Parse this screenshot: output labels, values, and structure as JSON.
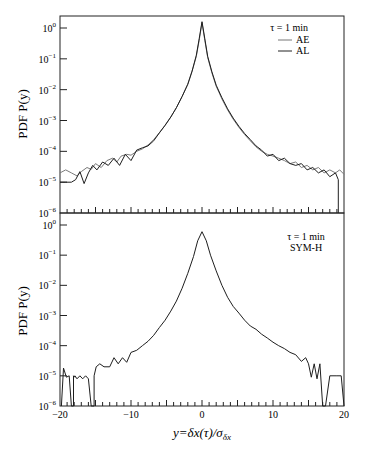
{
  "figure": {
    "xlabel": "y=δx(τ)/σ",
    "xlabel_sub": "δx",
    "ylabel": "PDF P(y)"
  },
  "chart_data": [
    {
      "type": "line",
      "panel": "top",
      "title": "",
      "xlabel": "y=δx(τ)/σ_δx",
      "ylabel": "PDF P(y)",
      "xlim": [
        -20,
        20
      ],
      "ylim": [
        1e-06,
        2
      ],
      "yscale": "log",
      "yticks": [
        "10^0",
        "10^-1",
        "10^-2",
        "10^-3",
        "10^-4",
        "10^-5",
        "10^-6"
      ],
      "xticks": [],
      "grid": false,
      "legend": {
        "position": "upper right",
        "header": "τ = 1 min",
        "entries": [
          "AE",
          "AL"
        ]
      },
      "series": [
        {
          "name": "AE",
          "x": [
            -20,
            -19.2,
            -18.4,
            -17.6,
            -17,
            -16.2,
            -15.6,
            -15,
            -14.2,
            -13.4,
            -12.6,
            -12,
            -11.4,
            -10.6,
            -10,
            -9.2,
            -8.4,
            -7.6,
            -6.8,
            -6,
            -5.2,
            -4.4,
            -3.6,
            -2.8,
            -2,
            -1.4,
            -0.8,
            -0.4,
            0,
            0.4,
            0.8,
            1.4,
            2,
            2.8,
            3.6,
            4.4,
            5.2,
            6,
            6.8,
            7.6,
            8.4,
            9.2,
            10,
            10.8,
            11.6,
            12.4,
            13.2,
            14,
            14.8,
            15.6,
            16.4,
            17.2,
            18,
            18.8,
            19.4,
            20
          ],
          "y": [
            2e-05,
            2.5e-05,
            2e-05,
            1.6e-05,
            2.2e-05,
            3e-05,
            2.6e-05,
            4e-05,
            3e-05,
            5e-05,
            6e-05,
            4.5e-05,
            7e-05,
            8e-05,
            7.5e-05,
            0.0001,
            0.00012,
            0.00016,
            0.00024,
            0.0004,
            0.0007,
            0.0013,
            0.0026,
            0.006,
            0.015,
            0.04,
            0.12,
            0.4,
            1.5,
            0.4,
            0.11,
            0.035,
            0.013,
            0.005,
            0.0022,
            0.0011,
            0.0006,
            0.00035,
            0.00022,
            0.00014,
            0.0001,
            8e-05,
            7e-05,
            6e-05,
            5e-05,
            4e-05,
            4.5e-05,
            3e-05,
            3.5e-05,
            2.5e-05,
            3e-05,
            2e-05,
            2.5e-05,
            2e-05,
            2.5e-05,
            1.8e-05
          ]
        },
        {
          "name": "AL",
          "x": [
            -20,
            -19.2,
            -18.4,
            -17.8,
            -17.2,
            -16.6,
            -16,
            -15.4,
            -14.8,
            -14,
            -13.2,
            -12.4,
            -11.6,
            -10.8,
            -10,
            -9.2,
            -8.4,
            -7.6,
            -6.8,
            -6,
            -5.2,
            -4.4,
            -3.6,
            -2.8,
            -2,
            -1.4,
            -0.8,
            -0.4,
            0,
            0.4,
            0.8,
            1.4,
            2,
            2.8,
            3.6,
            4.4,
            5.2,
            6,
            6.8,
            7.6,
            8.4,
            9.2,
            10,
            10.8,
            11.6,
            12.4,
            13.2,
            14,
            14.8,
            15.6,
            16.4,
            17.2,
            18,
            18.8,
            19.2,
            19.2
          ],
          "y": [
            1e-05,
            1e-05,
            1e-05,
            1.2e-05,
            2.2e-05,
            9e-06,
            2e-05,
            3.5e-05,
            2.5e-05,
            4.5e-05,
            3.5e-05,
            6e-05,
            3.5e-05,
            8e-05,
            5e-05,
            0.00011,
            0.00013,
            0.00015,
            0.00022,
            0.0004,
            0.0007,
            0.0013,
            0.0026,
            0.006,
            0.015,
            0.04,
            0.13,
            0.45,
            1.6,
            0.45,
            0.12,
            0.038,
            0.014,
            0.0055,
            0.0024,
            0.0012,
            0.00065,
            0.00038,
            0.00024,
            0.00015,
            0.00011,
            7e-05,
            8e-05,
            5e-05,
            6e-05,
            4e-05,
            3.5e-05,
            4e-05,
            2.5e-05,
            3e-05,
            2e-05,
            2.5e-05,
            1.5e-05,
            2e-05,
            1.2e-05,
            1e-06
          ]
        }
      ]
    },
    {
      "type": "line",
      "panel": "bottom",
      "title": "",
      "xlabel": "y=δx(τ)/σ_δx",
      "ylabel": "PDF P(y)",
      "xlim": [
        -20,
        20
      ],
      "ylim": [
        1e-06,
        2
      ],
      "yscale": "log",
      "yticks": [
        "10^0",
        "10^-1",
        "10^-2",
        "10^-3",
        "10^-4",
        "10^-5",
        "10^-6"
      ],
      "xticks": [
        "-20",
        "-10",
        "0",
        "10",
        "20"
      ],
      "grid": false,
      "legend": {
        "position": "upper right",
        "header": "τ = 1 min",
        "entries": [
          "SYM-H"
        ]
      },
      "series": [
        {
          "name": "SYM-H",
          "x": [
            -19.8,
            -19.5,
            -19.1,
            -18.7,
            -18.4,
            -18.1,
            -18.1,
            -17.9,
            -17.9,
            -17.6,
            -17.2,
            -16.8,
            -16.4,
            -16,
            -15.6,
            -15.6,
            -15.2,
            -15.2,
            -14.9,
            -14.4,
            -13.8,
            -13,
            -12.4,
            -11.8,
            -11.2,
            -10.6,
            -10,
            -9.2,
            -8.4,
            -7.6,
            -6.8,
            -6,
            -5.2,
            -4.4,
            -3.6,
            -2.8,
            -2,
            -1.2,
            -0.6,
            0,
            0.6,
            1.2,
            2,
            2.8,
            3.6,
            4.4,
            5.2,
            6,
            6.8,
            7.6,
            8.4,
            9.2,
            10,
            10.8,
            11.6,
            12.4,
            13.2,
            14,
            14.6,
            15,
            15.4,
            15.8,
            16.2,
            16.6,
            17,
            17,
            17.4,
            17.4,
            18,
            19,
            19.6,
            20
          ],
          "y": [
            1e-06,
            1.8e-05,
            9e-06,
            1e-05,
            1e-06,
            1e-06,
            1e-05,
            9e-06,
            1e-05,
            8e-06,
            1e-05,
            8e-06,
            1e-05,
            8e-06,
            1e-06,
            1e-06,
            1e-06,
            1e-05,
            2e-05,
            2.5e-05,
            2e-05,
            2e-05,
            4e-05,
            2.5e-05,
            4e-05,
            2.8e-05,
            6e-05,
            7e-05,
            0.0001,
            0.00014,
            0.00022,
            0.0004,
            0.0007,
            0.0014,
            0.003,
            0.008,
            0.025,
            0.09,
            0.3,
            0.6,
            0.3,
            0.1,
            0.03,
            0.01,
            0.004,
            0.002,
            0.0012,
            0.0007,
            0.00045,
            0.00035,
            0.00024,
            0.00018,
            0.00013,
            0.0001,
            8e-05,
            6e-05,
            5e-05,
            3e-05,
            4e-05,
            2.5e-05,
            9e-06,
            2.5e-05,
            8e-06,
            2.5e-05,
            1e-06,
            1e-06,
            1e-06,
            1e-06,
            1e-05,
            1e-05,
            1e-05,
            1e-06
          ]
        }
      ]
    }
  ]
}
